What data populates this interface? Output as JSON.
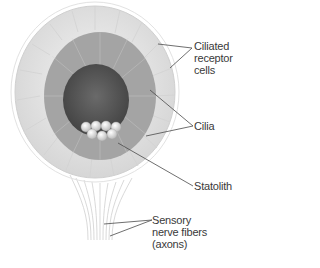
{
  "diagram": {
    "labels": {
      "ciliated_receptor_cells": [
        "Ciliated",
        "receptor",
        "cells"
      ],
      "cilia": "Cilia",
      "statolith": "Statolith",
      "sensory_nerve_fibers": [
        "Sensory",
        "nerve fibers",
        "(axons)"
      ]
    },
    "colors": {
      "outer_cells": "#e6e6e6",
      "cilia_field": "#9a9a9a",
      "inner_mass": "#555555",
      "statolith": "#dcdcdc",
      "leader_lines": "#4a4a4a",
      "text": "#3a3a3a"
    }
  }
}
